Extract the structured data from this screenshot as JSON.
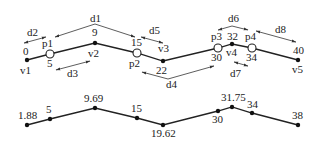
{
  "top": {
    "vertices": [
      {
        "id": "v1",
        "label": "v1",
        "value": "0",
        "x": 27,
        "y": 60,
        "kind": "vertex"
      },
      {
        "id": "p1",
        "label": "p1",
        "value": "5",
        "x": 50,
        "y": 54,
        "kind": "point"
      },
      {
        "id": "v2",
        "label": "v2",
        "value": "9",
        "x": 95,
        "y": 43,
        "kind": "vertex"
      },
      {
        "id": "p2",
        "label": "p2",
        "value": "15",
        "x": 137,
        "y": 53,
        "kind": "point"
      },
      {
        "id": "v3",
        "label": "v3",
        "value": "22",
        "x": 163,
        "y": 61,
        "kind": "vertex"
      },
      {
        "id": "p3",
        "label": "p3",
        "value": "30",
        "x": 218,
        "y": 48,
        "kind": "point"
      },
      {
        "id": "v4",
        "label": "v4",
        "value": "32",
        "x": 232,
        "y": 44,
        "kind": "vertex"
      },
      {
        "id": "p4",
        "label": "p4",
        "value": "34",
        "x": 252,
        "y": 48,
        "kind": "point"
      },
      {
        "id": "v5",
        "label": "v5",
        "value": "40",
        "x": 298,
        "y": 60,
        "kind": "vertex"
      }
    ],
    "distances": [
      "d1",
      "d2",
      "d3",
      "d4",
      "d5",
      "d6",
      "d7",
      "d8"
    ]
  },
  "bottom": {
    "points": [
      {
        "value": "1.88",
        "x": 27,
        "y": 125
      },
      {
        "value": "5",
        "x": 50,
        "y": 119
      },
      {
        "value": "9.69",
        "x": 95,
        "y": 108
      },
      {
        "value": "15",
        "x": 137,
        "y": 118
      },
      {
        "value": "19.62",
        "x": 163,
        "y": 125
      },
      {
        "value": "30",
        "x": 218,
        "y": 111
      },
      {
        "value": "31.75",
        "x": 232,
        "y": 107
      },
      {
        "value": "34",
        "x": 252,
        "y": 113
      },
      {
        "value": "38",
        "x": 298,
        "y": 125
      }
    ]
  }
}
